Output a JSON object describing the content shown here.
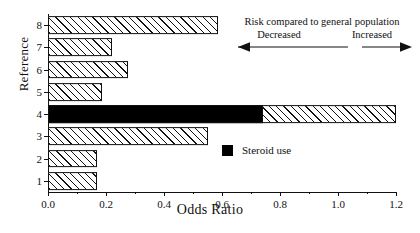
{
  "chart_data": {
    "type": "bar",
    "orientation": "horizontal",
    "title": "",
    "xlabel": "Odds Ratio",
    "ylabel": "Reference",
    "xlim": [
      0.0,
      1.2
    ],
    "xticks": [
      0.0,
      0.2,
      0.4,
      0.6,
      0.8,
      1.0,
      1.2
    ],
    "xtick_labels": [
      "0.0",
      "0.2",
      "0.4",
      "0.6",
      "0.8",
      "1.0",
      "1.2"
    ],
    "categories": [
      "1",
      "2",
      "3",
      "4",
      "5",
      "6",
      "7",
      "8"
    ],
    "ytick_labels": [
      "1",
      "2",
      "3",
      "4",
      "5",
      "6",
      "7",
      "8"
    ],
    "values": [
      0.17,
      0.17,
      0.55,
      1.2,
      0.185,
      0.275,
      0.22,
      0.585
    ],
    "grid": false,
    "bars": [
      {
        "category": "1",
        "value": 0.17,
        "fill": "hatch"
      },
      {
        "category": "2",
        "value": 0.17,
        "fill": "hatch"
      },
      {
        "category": "3",
        "value": 0.55,
        "fill": "hatch"
      },
      {
        "category": "4",
        "value": 1.2,
        "fill": "split",
        "solid_to": 0.74,
        "note": "Steroid use"
      },
      {
        "category": "5",
        "value": 0.185,
        "fill": "hatch"
      },
      {
        "category": "6",
        "value": 0.275,
        "fill": "hatch"
      },
      {
        "category": "7",
        "value": 0.22,
        "fill": "hatch"
      },
      {
        "category": "8",
        "value": 0.585,
        "fill": "hatch"
      }
    ],
    "legend": {
      "position": "inside-right",
      "entries": [
        {
          "label": "Steroid use",
          "color": "#000000",
          "fill": "solid"
        }
      ]
    },
    "annotations": {
      "title": "Risk compared to general population",
      "left_label": "Decreased",
      "right_label": "Increased",
      "left_arrow": "left-arrow-icon",
      "right_arrow": "right-arrow-icon"
    }
  },
  "axis": {
    "x_title": "Odds Ratio",
    "y_title": "Reference"
  },
  "colors": {
    "ink": "#111111",
    "solid_bar": "#000000",
    "background": "#ffffff"
  }
}
